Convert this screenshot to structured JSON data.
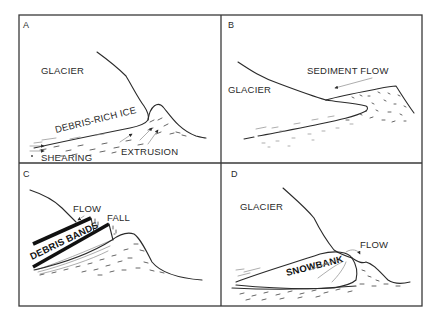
{
  "figure": {
    "panels": [
      {
        "id": "A",
        "labels": {
          "glacier": "GLACIER",
          "debris_rich_ice": "DEBRIS-RICH ICE",
          "extrusion": "EXTRUSION",
          "shearing": "SHEARING"
        }
      },
      {
        "id": "B",
        "labels": {
          "glacier": "GLACIER",
          "sediment_flow": "SEDIMENT FLOW"
        }
      },
      {
        "id": "C",
        "labels": {
          "flow": "FLOW",
          "fall": "FALL",
          "debris_bands": "DEBRIS BANDS"
        }
      },
      {
        "id": "D",
        "labels": {
          "glacier": "GLACIER",
          "flow": "FLOW",
          "snowbank": "SNOWBANK"
        }
      }
    ],
    "colors": {
      "ink": "#2a2a2a",
      "background": "#ffffff"
    }
  }
}
